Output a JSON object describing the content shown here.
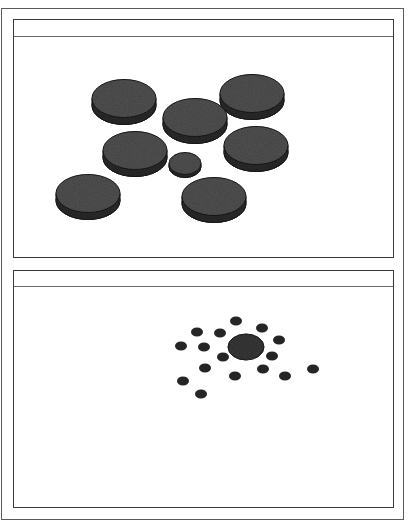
{
  "figure": {
    "panels": [
      {
        "id": "top-panel",
        "box": {
          "x": 13,
          "y": 19,
          "w": 381,
          "h": 239
        },
        "header_height": 17,
        "discs": [
          {
            "name": "large-disc",
            "cx": 123,
            "cy": 101,
            "rx": 32,
            "ry": 19,
            "thickness": 7
          },
          {
            "name": "large-disc",
            "cx": 251,
            "cy": 96,
            "rx": 32,
            "ry": 19,
            "thickness": 7
          },
          {
            "name": "large-disc",
            "cx": 194,
            "cy": 120,
            "rx": 32,
            "ry": 19,
            "thickness": 7
          },
          {
            "name": "large-disc",
            "cx": 134,
            "cy": 153,
            "rx": 32,
            "ry": 19,
            "thickness": 7
          },
          {
            "name": "large-disc",
            "cx": 255,
            "cy": 148,
            "rx": 32,
            "ry": 19,
            "thickness": 7
          },
          {
            "name": "small-disc",
            "cx": 184,
            "cy": 164,
            "rx": 16,
            "ry": 11,
            "thickness": 3
          },
          {
            "name": "large-disc",
            "cx": 87,
            "cy": 196,
            "rx": 32,
            "ry": 19,
            "thickness": 7
          },
          {
            "name": "large-disc",
            "cx": 213,
            "cy": 199,
            "rx": 32,
            "ry": 19,
            "thickness": 7
          }
        ]
      },
      {
        "id": "bottom-panel",
        "box": {
          "x": 13,
          "y": 270,
          "w": 381,
          "h": 238
        },
        "header_height": 16,
        "center_disc": {
          "cx": 245,
          "cy": 346,
          "rx": 18,
          "ry": 13
        },
        "dots": [
          {
            "cx": 235,
            "cy": 320
          },
          {
            "cx": 196,
            "cy": 331
          },
          {
            "cx": 219,
            "cy": 332
          },
          {
            "cx": 261,
            "cy": 327
          },
          {
            "cx": 180,
            "cy": 345
          },
          {
            "cx": 203,
            "cy": 346
          },
          {
            "cx": 278,
            "cy": 339
          },
          {
            "cx": 222,
            "cy": 356
          },
          {
            "cx": 271,
            "cy": 355
          },
          {
            "cx": 204,
            "cy": 367
          },
          {
            "cx": 262,
            "cy": 368
          },
          {
            "cx": 234,
            "cy": 375
          },
          {
            "cx": 284,
            "cy": 375
          },
          {
            "cx": 312,
            "cy": 368
          },
          {
            "cx": 182,
            "cy": 380
          },
          {
            "cx": 200,
            "cy": 393
          }
        ],
        "dot_rx": 6,
        "dot_ry": 4.5
      }
    ],
    "colors": {
      "disc_top": "#555555",
      "disc_side": "#2e2e2e",
      "disc_edge": "#1e1e1e",
      "dot": "#252525",
      "frame": "#3a3a3a"
    }
  }
}
